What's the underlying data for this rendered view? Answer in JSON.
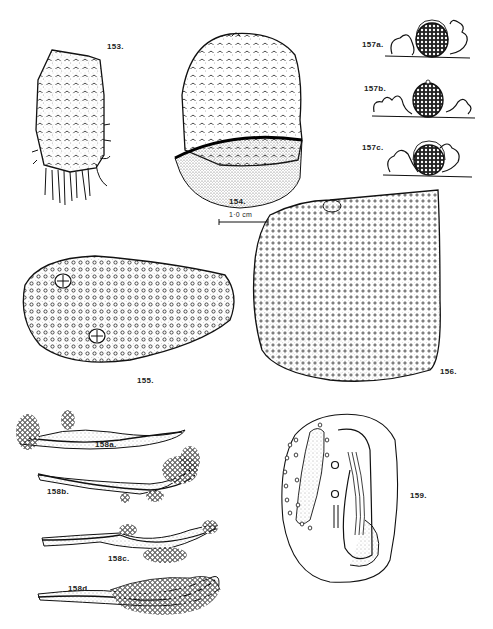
{
  "plate": {
    "figures": [
      {
        "id": "153",
        "label": "153."
      },
      {
        "id": "154",
        "label": "154."
      },
      {
        "id": "155",
        "label": "155."
      },
      {
        "id": "156",
        "label": "156."
      },
      {
        "id": "157a",
        "label": "157a."
      },
      {
        "id": "157b",
        "label": "157b."
      },
      {
        "id": "157c",
        "label": "157c."
      },
      {
        "id": "158a",
        "label": "158a."
      },
      {
        "id": "158b",
        "label": "158b."
      },
      {
        "id": "158c",
        "label": "158c."
      },
      {
        "id": "158d",
        "label": "158d."
      },
      {
        "id": "159",
        "label": "159."
      }
    ],
    "scale_bar": {
      "label": "1·0 cm"
    }
  },
  "colors": {
    "ink": "#111111",
    "paper": "#ffffff",
    "stipple": "#555555"
  }
}
